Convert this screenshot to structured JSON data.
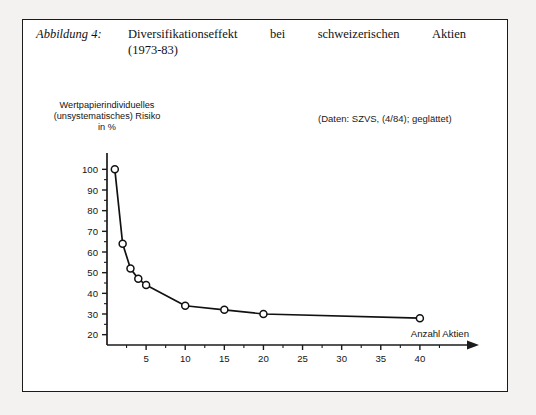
{
  "caption": {
    "tag": "Abbildung 4:",
    "line1_words": [
      "Diversifikationseffekt",
      "bei",
      "schweizerischen",
      "Aktien"
    ],
    "line2": "(1973-83)"
  },
  "source_note": "(Daten: SZVS, (4/84); geglättet)",
  "y_axis_caption": {
    "line1": "Wertpapierindividuelles",
    "line2": "(unsystematisches) Risiko",
    "line3": "in %"
  },
  "chart_data": {
    "type": "line",
    "title": "Diversifikationseffekt bei schweizerischen Aktien (1973-83)",
    "xlabel": "Anzahl Aktien",
    "ylabel": "Wertpapierindividuelles (unsystematisches) Risiko in %",
    "annotation": "(Daten: SZVS, (4/84); geglättet)",
    "grid": false,
    "legend": "none",
    "xlim": [
      0,
      45
    ],
    "ylim": [
      15,
      105
    ],
    "x_ticks": [
      5,
      10,
      15,
      20,
      25,
      30,
      35,
      40
    ],
    "x_tick_labels": [
      "5",
      "10",
      "15",
      "20",
      "25",
      "30",
      "35",
      "40"
    ],
    "x_minor_tick_step": 2.5,
    "y_ticks": [
      20,
      30,
      40,
      50,
      60,
      70,
      80,
      90,
      100
    ],
    "y_tick_labels": [
      "20",
      "30",
      "40",
      "50",
      "60",
      "70",
      "80",
      "90",
      "100"
    ],
    "marker": "open-circle",
    "x": [
      1,
      2,
      3,
      4,
      5,
      10,
      15,
      20,
      40
    ],
    "values": [
      100,
      64,
      52,
      47,
      44,
      34,
      32,
      30,
      28
    ]
  },
  "colors": {
    "page_background": "#f3f2f0",
    "frame_background": "#ffffff",
    "ink": "#1b1b1b",
    "curve": "#111111"
  }
}
